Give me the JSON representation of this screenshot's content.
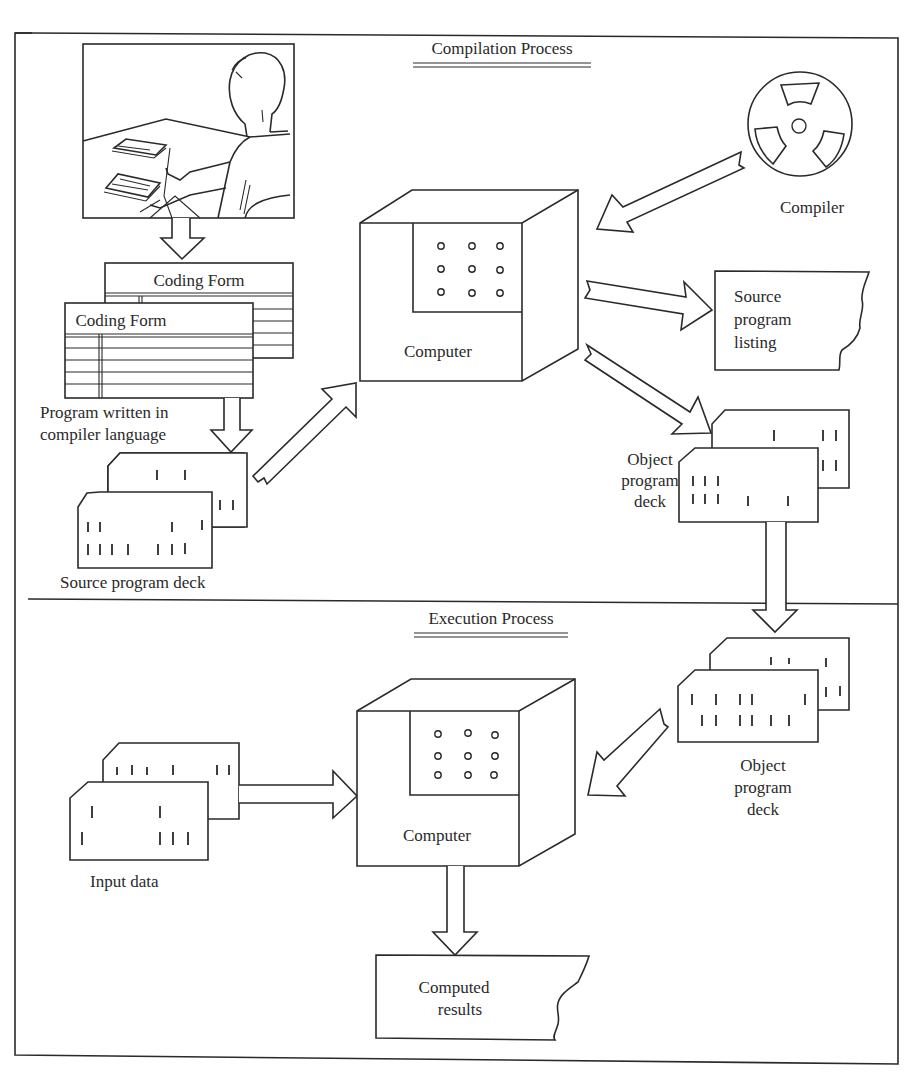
{
  "figure": {
    "sections": {
      "compilation": {
        "title": "Compilation Process"
      },
      "execution": {
        "title": "Execution Process"
      }
    },
    "compilation": {
      "programmer_illustration": "programmer-at-desk-illustration",
      "coding_forms": [
        {
          "label": "Coding Form"
        },
        {
          "label": "Coding Form"
        }
      ],
      "coding_form_caption_line1": "Program written in",
      "coding_form_caption_line2": "compiler language",
      "source_deck_label": "Source program deck",
      "computer_label": "Computer",
      "compiler_label": "Compiler",
      "listing_line1": "Source",
      "listing_line2": "program",
      "listing_line3": "listing",
      "object_deck_line1": "Object",
      "object_deck_line2": "program",
      "object_deck_line3": "deck"
    },
    "execution": {
      "input_data_label": "Input data",
      "computer_label": "Computer",
      "object_deck_line1": "Object",
      "object_deck_line2": "program",
      "object_deck_line3": "deck",
      "results_line1": "Computed",
      "results_line2": "results"
    },
    "icons": {
      "compiler": "tape-reel-icon",
      "computer": "computer-cabinet-icon",
      "deck": "punched-card-deck-icon",
      "printout": "torn-printout-icon",
      "arrow": "block-arrow-icon"
    },
    "colors": {
      "ink": "#2a2a2a",
      "paper": "#ffffff"
    }
  }
}
